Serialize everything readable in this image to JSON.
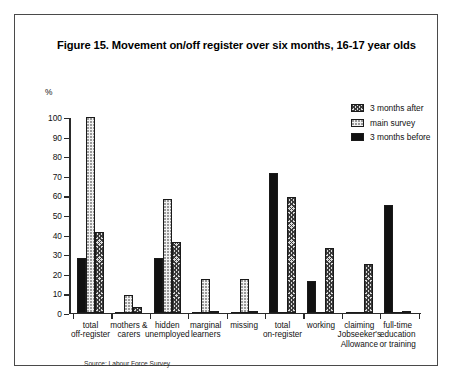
{
  "figure": {
    "title": "Figure 15. Movement on/off register over six months, 16-17 year olds",
    "source": "Source: Labour Force Survey"
  },
  "legend": {
    "position": "top-right",
    "items": [
      {
        "label": "3 months after",
        "key": "after",
        "swatch": "dark-crosshatch"
      },
      {
        "label": "main survey",
        "key": "main",
        "swatch": "light-dotted"
      },
      {
        "label": "3 months before",
        "key": "before",
        "swatch": "solid-black"
      }
    ]
  },
  "chart_data": {
    "type": "bar",
    "title": "Figure 15. Movement on/off register over six months, 16-17 year olds",
    "xlabel": "",
    "ylabel": "%",
    "ylim": [
      0,
      100
    ],
    "yticks": [
      0,
      10,
      20,
      30,
      40,
      50,
      60,
      70,
      80,
      90,
      100
    ],
    "ytick_labels": [
      "0",
      "10",
      "20",
      "30",
      "40",
      "50",
      "60",
      "70",
      "80",
      "90",
      "100"
    ],
    "grid": false,
    "legend_position": "top-right",
    "bar_order": [
      "3 months before",
      "main survey",
      "3 months after"
    ],
    "categories": [
      "total\noff-register",
      "mothers &\ncarers",
      "hidden\nunemployed",
      "marginal\nlearners",
      "missing",
      "total\non-register",
      "working",
      "claiming\nJobseeker's\nAllowance",
      "full-time\neducation\nor training"
    ],
    "series": [
      {
        "name": "3 months before",
        "values": [
          28,
          0,
          28,
          0,
          0,
          71,
          16,
          0,
          55
        ]
      },
      {
        "name": "main survey",
        "values": [
          100,
          9,
          58,
          17,
          17,
          0,
          0,
          0,
          0
        ]
      },
      {
        "name": "3 months after",
        "values": [
          41,
          3,
          36,
          1,
          1,
          59,
          33,
          25,
          1
        ]
      }
    ]
  }
}
